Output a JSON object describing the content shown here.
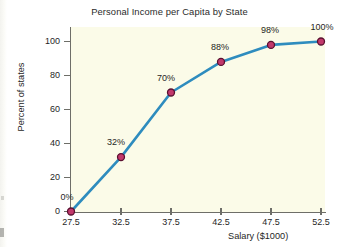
{
  "chart_data": {
    "type": "line",
    "title": "Personal Income per Capita by State",
    "xlabel": "Salary ($1000)",
    "ylabel": "Percent of states",
    "x": [
      27.5,
      32.5,
      37.5,
      42.5,
      47.5,
      52.5
    ],
    "values": [
      0,
      32,
      70,
      88,
      98,
      100
    ],
    "point_labels": [
      "0%",
      "32%",
      "70%",
      "88%",
      "98%",
      "100%"
    ],
    "xlim": [
      27.5,
      52.5
    ],
    "ylim": [
      0,
      100
    ],
    "xticks": [
      "27.5",
      "32.5",
      "37.5",
      "42.5",
      "47.5",
      "52.5"
    ],
    "yticks": [
      "0",
      "20",
      "40",
      "60",
      "80",
      "100"
    ],
    "grid": false,
    "legend": "none",
    "series": [
      {
        "name": "Cumulative percent of states",
        "values": [
          0,
          32,
          70,
          88,
          98,
          100
        ]
      }
    ],
    "colors": {
      "line": "#2e8cbe",
      "marker_fill": "#c2386b",
      "marker_edge": "#5a1030",
      "plot_background": "#fbfbe8",
      "page_background": "#ffffff",
      "axis": "#6e6e68",
      "text": "#1f1f1f"
    }
  }
}
